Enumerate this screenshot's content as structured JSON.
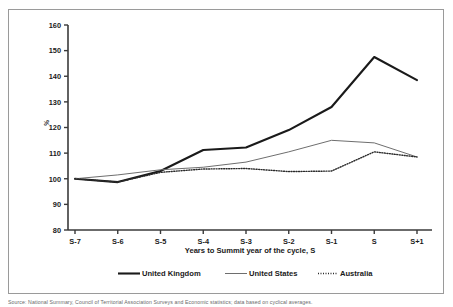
{
  "figure": {
    "caption": "Source:  National Summary, Council of Territorial Association Surveys and Economic statistics; data based on cyclical averages.",
    "top_fragment": ""
  },
  "chart_data": {
    "type": "line",
    "title": "",
    "subtitle": "",
    "xlabel": "Years to Summit year of the cycle, S",
    "ylabel": "%",
    "categories": [
      "S-7",
      "S-6",
      "S-5",
      "S-4",
      "S-3",
      "S-2",
      "S-1",
      "S",
      "S+1"
    ],
    "ylim": [
      80,
      160
    ],
    "yticks": [
      80,
      90,
      100,
      110,
      120,
      130,
      140,
      150,
      160
    ],
    "grid": false,
    "legend_position": "bottom",
    "series": [
      {
        "name": "United Kingdom",
        "style": "solid-thick",
        "color": "#1a1a1a",
        "values": [
          100,
          98.7,
          103.0,
          111.2,
          112.2,
          119.0,
          128.0,
          147.5,
          138.5
        ]
      },
      {
        "name": "United States",
        "style": "solid-thin",
        "color": "#6e6e6e",
        "values": [
          100,
          101.5,
          103.5,
          104.5,
          106.5,
          110.5,
          115.0,
          114.0,
          108.5
        ]
      },
      {
        "name": "Australia",
        "style": "dotted",
        "color": "#2a2a2a",
        "values": [
          100,
          98.7,
          102.5,
          103.8,
          104.0,
          102.8,
          103.0,
          110.5,
          108.5
        ]
      }
    ]
  },
  "axis": {
    "y_tick_labels": [
      "160",
      "150",
      "140",
      "130",
      "120",
      "110",
      "100",
      "90",
      "80"
    ],
    "x_tick_labels": [
      "S-7",
      "S-6",
      "S-5",
      "S-4",
      "S-3",
      "S-2",
      "S-1",
      "S",
      "S+1"
    ]
  },
  "legend": {
    "items": [
      {
        "label": "United Kingdom"
      },
      {
        "label": "United States"
      },
      {
        "label": "Australia"
      }
    ]
  }
}
